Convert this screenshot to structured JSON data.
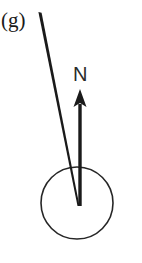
{
  "figure": {
    "panel_label": "(g)",
    "vector_label": "N",
    "background_color": "#ffffff",
    "ink_color": "#1a1a1a",
    "circle_stroke_color": "#262626",
    "elements": {
      "circle": {
        "name": "body-circle",
        "center_x": 77,
        "center_y": 203,
        "radius": 36,
        "stroke_width": 1.6,
        "filled": false
      },
      "diagonal_line": {
        "name": "incident-ray-line",
        "x1": 40,
        "y1": 12,
        "x2": 78.5,
        "y2": 206,
        "stroke_width_top": 3.2,
        "stroke_width_bottom": 2.0
      },
      "arrow": {
        "name": "normal-vector-arrow",
        "tail_x": 80,
        "tail_y": 206,
        "tip_x": 80,
        "tip_y": 89,
        "shaft_width": 3.4,
        "head_half_width": 6.5,
        "head_length": 18
      }
    }
  }
}
